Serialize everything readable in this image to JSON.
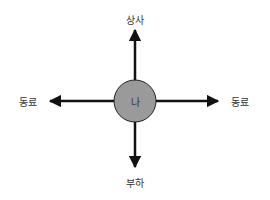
{
  "diagram": {
    "center": {
      "label": "나",
      "fill": "#9a9a9a",
      "stroke": "#222222"
    },
    "nodes": {
      "top": {
        "label": "상사"
      },
      "bottom": {
        "label": "부하"
      },
      "left": {
        "label": "동료"
      },
      "right": {
        "label": "동료"
      }
    },
    "arrow_color": "#111111"
  }
}
